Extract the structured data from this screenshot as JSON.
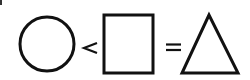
{
  "diagram": {
    "items": [
      {
        "kind": "shape",
        "shape": "circle"
      },
      {
        "kind": "operator",
        "symbol": "<"
      },
      {
        "kind": "shape",
        "shape": "square"
      },
      {
        "kind": "operator",
        "symbol": "="
      },
      {
        "kind": "shape",
        "shape": "triangle"
      }
    ],
    "stroke_color": "#111111",
    "background_color": "#ffffff"
  }
}
